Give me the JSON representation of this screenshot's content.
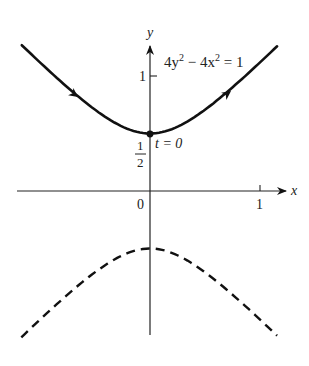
{
  "figure": {
    "type": "parametric hyperbola plot",
    "equation": {
      "coef_y": "4y",
      "exp_y": "2",
      "minus": " − 4x",
      "exp_x": "2",
      "rhs": " = 1"
    },
    "axes": {
      "x_label": "x",
      "y_label": "y",
      "origin_label": "0",
      "x_tick_label": "1",
      "y_tick_label": "1"
    },
    "point": {
      "y_value_num": "1",
      "y_value_den": "2",
      "t_label": "t = 0"
    },
    "branches": [
      {
        "name": "upper",
        "style": "solid",
        "direction_arrows": true
      },
      {
        "name": "lower",
        "style": "dashed",
        "direction_arrows": false
      }
    ],
    "colors": {
      "ink": "#111111",
      "background": "#ffffff"
    }
  }
}
